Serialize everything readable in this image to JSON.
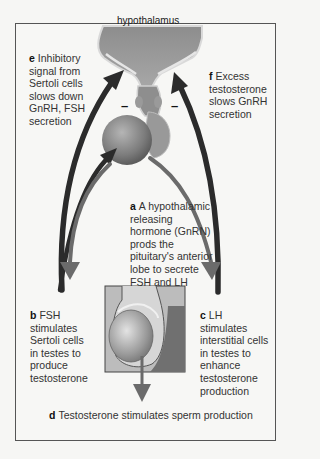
{
  "diagram": {
    "structures": {
      "hypothalamus_label": "hypothalamus"
    },
    "inhibition_marks": [
      "–",
      "–"
    ],
    "captions": {
      "a": {
        "letter": "a",
        "text": "A hypothalamic releasing hormone (GnRN) prods the pituitary's anterior lobe to secrete FSH and LH"
      },
      "b": {
        "letter": "b",
        "text": "FSH stimulates Sertoli cells in testes to produce testosterone"
      },
      "c": {
        "letter": "c",
        "text": "LH stimulates interstitial cells in testes to enhance testosterone production"
      },
      "d": {
        "letter": "d",
        "text": "Testosterone stimulates sperm production"
      },
      "e": {
        "letter": "e",
        "text": "Inhibitory signal from Sertoli cells slows down GnRH, FSH secretion"
      },
      "f": {
        "letter": "f",
        "text": "Excess testosterone slows GnRH secretion"
      }
    },
    "colors": {
      "inhibitory_arrow": "#2b2b2b",
      "stimulatory_arrow": "#6b6b6b",
      "tissue": "#8a8a8a",
      "frame": "#555555"
    }
  }
}
